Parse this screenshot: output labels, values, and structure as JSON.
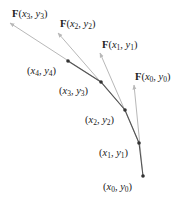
{
  "diagram": {
    "colors": {
      "path": "#555555",
      "vector": "#b8b8b8",
      "point": "#333333",
      "text": "#222222"
    },
    "points": [
      {
        "id": "p0",
        "label": "(x0, y0)",
        "var_x": "x",
        "sub_x": "0",
        "var_y": "y",
        "sub_y": "0"
      },
      {
        "id": "p1",
        "label": "(x1, y1)",
        "var_x": "x",
        "sub_x": "1",
        "var_y": "y",
        "sub_y": "1"
      },
      {
        "id": "p2",
        "label": "(x2, y2)",
        "var_x": "x",
        "sub_x": "2",
        "var_y": "y",
        "sub_y": "2"
      },
      {
        "id": "p3",
        "label": "(x3, y3)",
        "var_x": "x",
        "sub_x": "3",
        "var_y": "y",
        "sub_y": "3"
      },
      {
        "id": "p4",
        "label": "(x4, y4)",
        "var_x": "x",
        "sub_x": "4",
        "var_y": "y",
        "sub_y": "4"
      }
    ],
    "vectors": [
      {
        "label": "F(x0, y0)",
        "F": "F",
        "sub_x": "0",
        "sub_y": "0"
      },
      {
        "label": "F(x1, y1)",
        "F": "F",
        "sub_x": "1",
        "sub_y": "1"
      },
      {
        "label": "F(x2, y2)",
        "F": "F",
        "sub_x": "2",
        "sub_y": "2"
      },
      {
        "label": "F(x3, y3)",
        "F": "F",
        "sub_x": "3",
        "sub_y": "3"
      }
    ]
  }
}
